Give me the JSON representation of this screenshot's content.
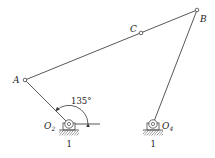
{
  "diagram": {
    "type": "four-bar linkage",
    "points": {
      "A": {
        "label": "A",
        "x": 25,
        "y": 80
      },
      "B": {
        "label": "B",
        "x": 197,
        "y": 10
      },
      "C": {
        "label": "C",
        "x": 141,
        "y": 33
      },
      "O2": {
        "label": "O",
        "sub": "2",
        "x": 69,
        "y": 124
      },
      "O4": {
        "label": "O",
        "sub": "4",
        "x": 153,
        "y": 124
      }
    },
    "links": [
      {
        "from": "O2",
        "to": "A",
        "name": "crank"
      },
      {
        "from": "A",
        "to": "B",
        "name": "coupler"
      },
      {
        "from": "O4",
        "to": "B",
        "name": "rocker"
      }
    ],
    "angle": {
      "label": "135°",
      "vertex": "O2",
      "from_deg": 0,
      "to_deg": 135
    },
    "ground_labels": [
      "1",
      "1"
    ],
    "colors": {
      "line": "#333333",
      "hatch": "#555555"
    }
  }
}
